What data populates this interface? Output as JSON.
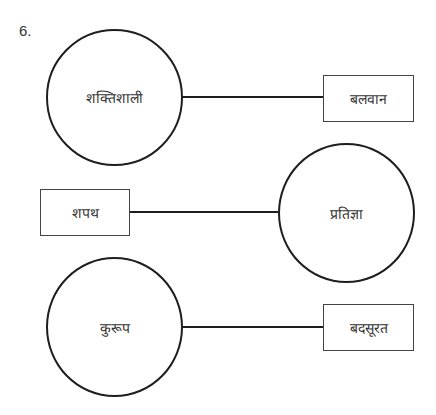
{
  "question_number": "6.",
  "pairs": [
    {
      "circle_word": "शक्तिशाली",
      "box_word": "बलवान"
    },
    {
      "box_word": "शपथ",
      "circle_word": "प्रतिज्ञा"
    },
    {
      "circle_word": "कुरूप",
      "box_word": "बदसूरत"
    }
  ]
}
